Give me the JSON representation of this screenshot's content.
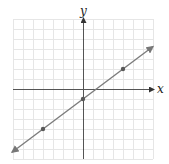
{
  "chart_data": {
    "type": "line",
    "title": "",
    "xlabel": "x",
    "ylabel": "y",
    "xlim": [
      -7,
      7
    ],
    "ylim": [
      -7,
      7
    ],
    "grid": true,
    "grid_step": 1,
    "tick_labels_shown": false,
    "series": [
      {
        "name": "y = 3/4 x - 1",
        "slope": 0.75,
        "intercept": -1,
        "line_extent_x": [
          -7.1,
          7.0
        ],
        "marked_points": [
          {
            "x": -4,
            "y": -4
          },
          {
            "x": 0,
            "y": -1
          },
          {
            "x": 4,
            "y": 2
          }
        ],
        "arrows_both_ends": true
      }
    ]
  },
  "colors": {
    "grid": "#e6e6e6",
    "axes": "#555555",
    "line": "#7a7a7a",
    "points": "#5a5a5a"
  },
  "labels": {
    "x_axis": "x",
    "y_axis": "y"
  }
}
